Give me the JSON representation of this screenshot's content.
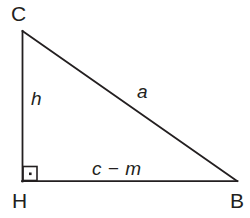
{
  "figure": {
    "type": "right-triangle-geometry-diagram",
    "background_color": "#ffffff",
    "stroke_color": "#231f20",
    "vertices": {
      "C": {
        "label": "C",
        "x": 22,
        "y": 31
      },
      "H": {
        "label": "H",
        "x": 22,
        "y": 181
      },
      "B": {
        "label": "B",
        "x": 237,
        "y": 181
      }
    },
    "sides": {
      "leg_vertical": {
        "label": "h",
        "from": "C",
        "to": "H"
      },
      "hypotenuse": {
        "label": "a",
        "from": "C",
        "to": "B"
      },
      "leg_horizontal": {
        "label": "c − m",
        "from": "H",
        "to": "B"
      }
    },
    "right_angle": {
      "at_vertex": "H",
      "marker": "square-with-dot",
      "size": 15
    }
  }
}
